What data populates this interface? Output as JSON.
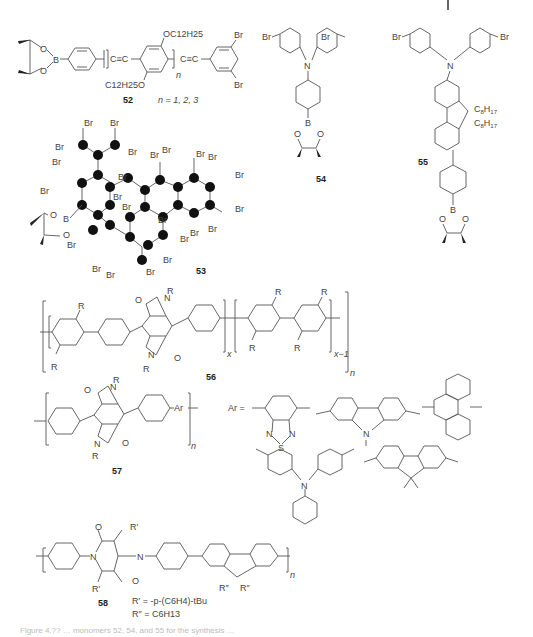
{
  "page": {
    "caption_partial": "Figure 4.?? … monomers 52, 54, and 55 for the synthesis …"
  },
  "compounds": {
    "c52": {
      "number": "52",
      "substituent_top": "OC12H25",
      "substituent_bottom": "C12H25O",
      "repeat_subscript": "n",
      "n_values": "n = 1, 2, 3",
      "halogen_top": "Br",
      "halogen_bottom": "Br",
      "boron_label": "B",
      "oxygen_label": "O"
    },
    "c53": {
      "number": "53",
      "halogen": "Br",
      "boron_label": "B",
      "oxygen_label": "O"
    },
    "c54": {
      "number": "54",
      "halogen": "Br",
      "nitrogen": "N",
      "boron_label": "B",
      "oxygen_label": "O"
    },
    "c55": {
      "number": "55",
      "halogen": "Br",
      "nitrogen": "N",
      "alkyl": "C8H17",
      "boron_label": "B",
      "oxygen_label": "O"
    },
    "c56": {
      "number": "56",
      "substituent": "R",
      "repeat_x": "x",
      "repeat_x1": "x−1",
      "repeat_n": "n"
    },
    "c57": {
      "number": "57",
      "substituent": "R",
      "aryl": "Ar",
      "repeat_n": "n",
      "ar_equals": "Ar ="
    },
    "ar_options": {
      "r_prime": "R′",
      "r_prime_def": "R′ = -p-(C6H4)-tBu",
      "r_dprime_def": "R″ = C6H13",
      "r_dprime": "R″"
    },
    "c58": {
      "number": "58",
      "r_prime": "R′",
      "r_dprime": "R″",
      "repeat_n": "n",
      "r_prime_def": "R′ = -p-(C6H4)-tBu",
      "r_dprime_def": "R″ = C6H13"
    }
  }
}
